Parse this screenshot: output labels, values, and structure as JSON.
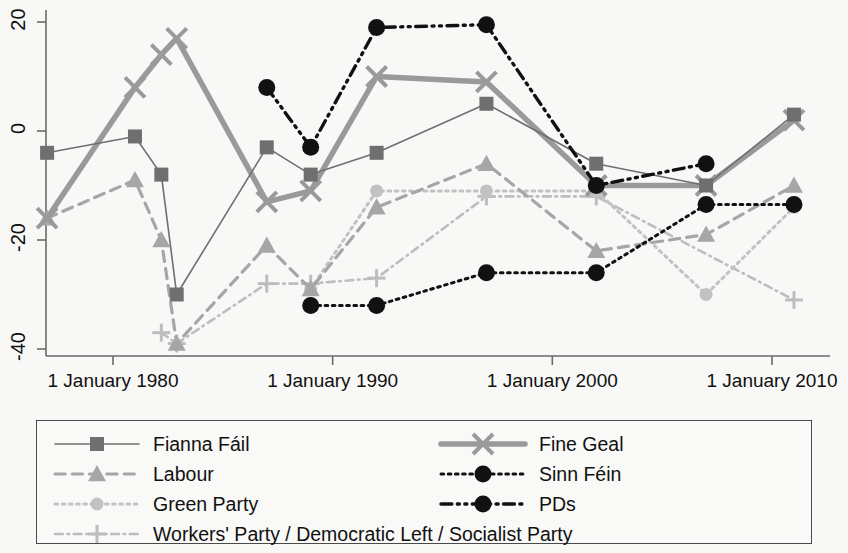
{
  "chart_data": {
    "type": "line",
    "title": "",
    "xlabel": "",
    "ylabel": "",
    "xlim": [
      1975.5,
      2011.5
    ],
    "ylim": [
      -43,
      23
    ],
    "x_ticks": [
      1980,
      1990,
      2000,
      2010
    ],
    "x_tick_labels": [
      "1 January 1980",
      "1 January 1990",
      "1 January 2000",
      "1 January 2010"
    ],
    "y_ticks": [
      20,
      0,
      -20,
      -40
    ],
    "y_tick_labels": [
      "20",
      "0",
      "-20",
      "-40"
    ],
    "grid": false,
    "legend_position": "below-plot",
    "series": [
      {
        "name": "Fianna Fáil",
        "color": "#6f6f6f",
        "line_style": "solid",
        "line_width": 1.6,
        "marker": "square",
        "x": [
          1977,
          1981,
          1982.2,
          1982.9,
          1987,
          1989,
          1992,
          1997,
          2002,
          2007,
          2011
        ],
        "values": [
          -4,
          -1,
          -8,
          -30,
          -3,
          -8,
          -4,
          5,
          -6,
          -10,
          3
        ]
      },
      {
        "name": "Fine Gael",
        "color": "#9a9a9a",
        "line_style": "solid",
        "line_width": 5.5,
        "marker": "x",
        "x": [
          1977,
          1981,
          1982.2,
          1982.9,
          1987,
          1989,
          1992,
          1997,
          2002,
          2007,
          2011
        ],
        "values": [
          -16,
          8,
          14,
          17,
          -13,
          -11,
          10,
          9,
          -10,
          -10,
          2
        ]
      },
      {
        "name": "Labour",
        "color": "#a6a6a6",
        "line_style": "dashed",
        "line_width": 3.2,
        "marker": "triangle",
        "x": [
          1977,
          1981,
          1982.2,
          1982.9,
          1987,
          1989,
          1992,
          1997,
          2002,
          2007,
          2011
        ],
        "values": [
          -16,
          -9,
          -20,
          -39,
          -21,
          -29,
          -14,
          -6,
          -22,
          -19,
          -10
        ]
      },
      {
        "name": "Green Party",
        "color": "#c2c2c2",
        "line_style": "dotted",
        "line_width": 3.0,
        "marker": "circle",
        "x": [
          1989,
          1992,
          1997,
          2002,
          2007,
          2011
        ],
        "values": [
          -29,
          -11,
          -11,
          -11,
          -30,
          -14
        ]
      },
      {
        "name": "Workers' Party / Democratic Left / Socialist Party",
        "color": "#bdbdbd",
        "line_style": "dashdot",
        "line_width": 2.6,
        "marker": "plus",
        "x": [
          1982.2,
          1982.9,
          1987,
          1989,
          1992,
          1997,
          2002,
          2011
        ],
        "values": [
          -37,
          -39,
          -28,
          -28,
          -27,
          -12,
          -12,
          -31
        ]
      },
      {
        "name": "Sinn Féin",
        "color": "#111111",
        "line_style": "dotted",
        "line_width": 3.0,
        "marker": "circle-filled",
        "x": [
          1989,
          1992,
          1997,
          2002,
          2007,
          2011
        ],
        "values": [
          -32,
          -32,
          -26,
          -26,
          -13.5,
          -13.5
        ]
      },
      {
        "name": "PDs",
        "color": "#111111",
        "line_style": "dashdotdot",
        "line_width": 3.4,
        "marker": "circle-filled",
        "x": [
          1987,
          1989,
          1992,
          1997,
          2002,
          2007
        ],
        "values": [
          8,
          -3,
          19,
          19.5,
          -10,
          -6
        ]
      }
    ]
  },
  "legend": {
    "entries": [
      {
        "label": "Fianna Fáil",
        "series": "Fianna Fáil"
      },
      {
        "label": "Fine Geal",
        "series": "Fine Gael"
      },
      {
        "label": "Labour",
        "series": "Labour"
      },
      {
        "label": "Sinn Féin",
        "series": "Sinn Féin"
      },
      {
        "label": "Green Party",
        "series": "Green Party"
      },
      {
        "label": "PDs",
        "series": "PDs"
      },
      {
        "label": "Workers' Party / Democratic Left / Socialist Party",
        "series": "Workers' Party / Democratic Left / Socialist Party"
      }
    ]
  },
  "axes": {
    "axis_color": "#6a6a6a",
    "background": "#f8f8f6"
  }
}
